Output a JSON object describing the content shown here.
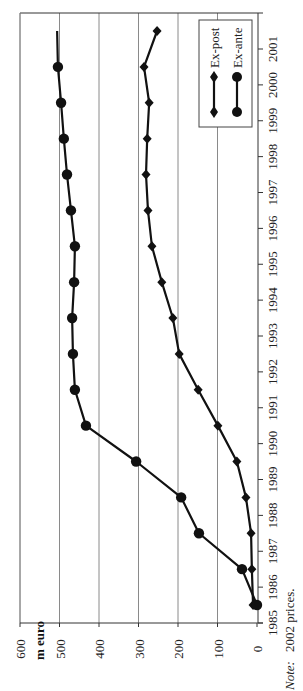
{
  "chart_data": {
    "type": "line",
    "orientation": "rotated-90-ccw",
    "title": "",
    "unit_label": "m euro",
    "xlabel": "",
    "ylabel": "m euro",
    "x": [
      1985,
      1986,
      1987,
      1988,
      1989,
      1990,
      1991,
      1992,
      1993,
      1994,
      1995,
      1996,
      1997,
      1998,
      1999,
      2000,
      2001
    ],
    "x_tick_labels": [
      "1985",
      "1986",
      "1987",
      "1988",
      "1989",
      "1990",
      "1991",
      "1992",
      "1993",
      "1994",
      "1995",
      "1996",
      "1997",
      "1998",
      "1999",
      "2000",
      "2001"
    ],
    "y_tick_labels": [
      "0",
      "100",
      "200",
      "300",
      "400",
      "500",
      "600"
    ],
    "ylim": [
      0,
      600
    ],
    "grid": true,
    "legend_position": "upper-right (rotated)",
    "series": [
      {
        "name": "Ex-post",
        "marker": "diamond",
        "values": [
          10,
          13,
          15,
          28,
          51,
          99,
          149,
          197,
          213,
          241,
          266,
          276,
          281,
          278,
          273,
          286,
          253
        ]
      },
      {
        "name": "Ex-ante",
        "marker": "circle",
        "values": [
          0,
          38,
          147,
          192,
          306,
          433,
          461,
          466,
          468,
          463,
          461,
          471,
          481,
          489,
          496,
          504,
          506
        ],
        "last_point_marker": false
      }
    ],
    "note": "Note: 2002 prices."
  },
  "legend": {
    "items": [
      {
        "label": "Ex-post",
        "marker": "diamond"
      },
      {
        "label": "Ex-ante",
        "marker": "circle"
      }
    ]
  },
  "labels": {
    "unit": "m euro",
    "note_prefix": "Note:",
    "note_text": "2002 prices."
  },
  "colors": {
    "series": "#111111",
    "grid": "#8a8a8a",
    "axis": "#333333",
    "background": "#ffffff"
  }
}
